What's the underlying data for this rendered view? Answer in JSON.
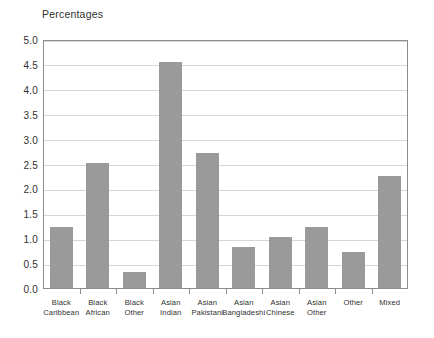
{
  "chart_data": {
    "type": "bar",
    "title": "Percentages",
    "xlabel": "",
    "ylabel": "",
    "ylim": [
      0.0,
      5.0
    ],
    "ytick_step": 0.5,
    "grid": true,
    "legend": "none",
    "bar_color": "#9a9a9a",
    "frame_color": "#8d8d8d",
    "gridline_color": "#d6d6d6",
    "categories": [
      "Black Caribbean",
      "Black African",
      "Black Other",
      "Asian Indian",
      "Asian Pakistani",
      "Asian Bangladeshi",
      "Asian Chinese",
      "Asian Other",
      "Other",
      "Mixed"
    ],
    "category_lines": [
      [
        "Black",
        "Caribbean"
      ],
      [
        "Black",
        "African"
      ],
      [
        "Black",
        "Other"
      ],
      [
        "Asian",
        "Indian"
      ],
      [
        "Asian",
        "Pakistani"
      ],
      [
        "Asian",
        "Bangladeshi"
      ],
      [
        "Asian",
        "Chinese"
      ],
      [
        "Asian",
        "Other"
      ],
      [
        "Other",
        ""
      ],
      [
        "Mixed",
        ""
      ]
    ],
    "values": [
      1.22,
      2.52,
      0.33,
      4.53,
      2.72,
      0.83,
      1.03,
      1.23,
      0.73,
      2.24
    ],
    "ytick_labels": [
      "0.0",
      "0.5",
      "1.0",
      "1.5",
      "2.0",
      "2.5",
      "3.0",
      "3.5",
      "4.0",
      "4.5",
      "5.0"
    ],
    "ytick_values": [
      0.0,
      0.5,
      1.0,
      1.5,
      2.0,
      2.5,
      3.0,
      3.5,
      4.0,
      4.5,
      5.0
    ]
  }
}
